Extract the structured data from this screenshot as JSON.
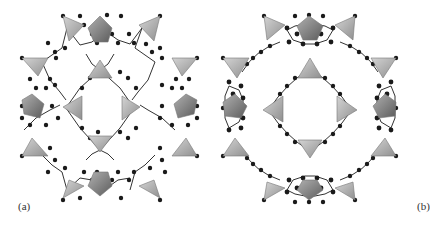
{
  "figure": {
    "panels": [
      {
        "id": "a",
        "label": "(a)",
        "description": "Framework with tetrahedral nodes linked by ball-and-stick ligand clusters"
      },
      {
        "id": "b",
        "label": "(b)",
        "description": "Framework with tetrahedral nodes linked by extended chain ligands and ring clusters"
      }
    ],
    "colors": {
      "polyhedron_light": "#bdbdbd",
      "polyhedron_dark": "#8a8a8a",
      "atom": "#1a1a1a",
      "bond": "#333333",
      "background": "#ffffff"
    }
  }
}
